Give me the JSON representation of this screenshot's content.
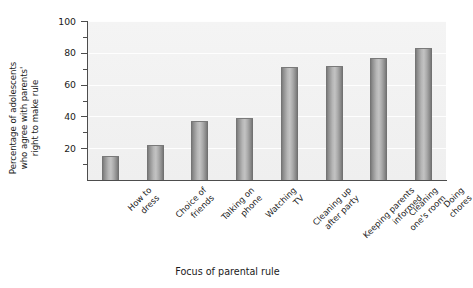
{
  "chart_data": {
    "type": "bar",
    "title": "",
    "xlabel": "Focus of parental rule",
    "ylabel": "Percentage of adolescents who agree with parents' right to make rule",
    "ylabel_lines": [
      "Percentage of adolescents",
      "who agree with parents'",
      "right to make rule"
    ],
    "categories": [
      "How to dress",
      "Choice of friends",
      "Talking on phone",
      "Watching TV",
      "Cleaning up after party",
      "Keeping parents informed",
      "Cleaning one's room",
      "Doing chores"
    ],
    "category_lines": [
      [
        "How to",
        "dress"
      ],
      [
        "Choice of",
        "friends"
      ],
      [
        "Talking on",
        "phone"
      ],
      [
        "Watching",
        "TV"
      ],
      [
        "Cleaning up",
        "after party"
      ],
      [
        "Keeping parents",
        "informed"
      ],
      [
        "Cleaning",
        "one's room"
      ],
      [
        "Doing",
        "chores"
      ]
    ],
    "values": [
      15,
      22,
      37,
      39,
      71,
      72,
      77,
      83
    ],
    "ylim": [
      0,
      100
    ],
    "ytick_labels": [
      "20",
      "40",
      "60",
      "80",
      "100"
    ],
    "ytick_values": [
      20,
      40,
      60,
      80,
      100
    ],
    "yminor_ticks": [
      10,
      30,
      50,
      70,
      90
    ],
    "grid": true,
    "legend": "none",
    "bar_color": "#a3a3a3",
    "plot_background": "#f1f1f1",
    "axis_color": "#4d4d4d"
  }
}
